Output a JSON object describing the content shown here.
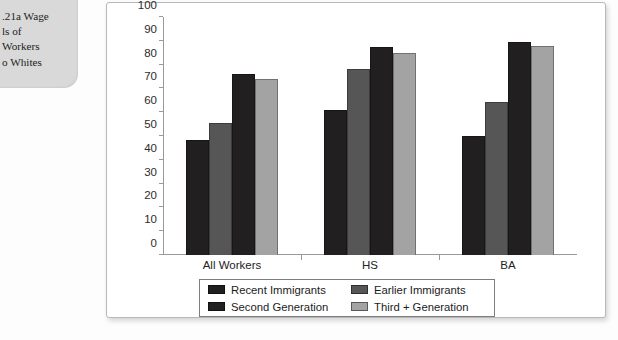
{
  "caption": {
    "text": ".21a Wage\nls of\nWorkers\no Whites"
  },
  "chart_data": {
    "type": "bar",
    "title": "",
    "xlabel": "",
    "ylabel": "",
    "ylim": [
      0,
      100
    ],
    "ytick_step": 10,
    "grid": false,
    "legend_position": "bottom",
    "categories": [
      "All Workers",
      "HS",
      "BA"
    ],
    "yticks": [
      "100",
      "90",
      "80",
      "70",
      "60",
      "50",
      "40",
      "30",
      "20",
      "10",
      "0"
    ],
    "series": [
      {
        "name": "Recent Immigrants",
        "color": "#211f1f",
        "values": [
          48.5,
          61.0,
          50.0
        ]
      },
      {
        "name": "Earlier Immigrants",
        "color": "#565656",
        "values": [
          55.5,
          78.0,
          64.5
        ]
      },
      {
        "name": "Second Generation",
        "color": "#211f1f",
        "values": [
          76.0,
          87.5,
          89.5
        ]
      },
      {
        "name": "Third + Generation",
        "color": "#a3a3a3",
        "values": [
          74.0,
          85.0,
          88.0
        ]
      }
    ]
  }
}
